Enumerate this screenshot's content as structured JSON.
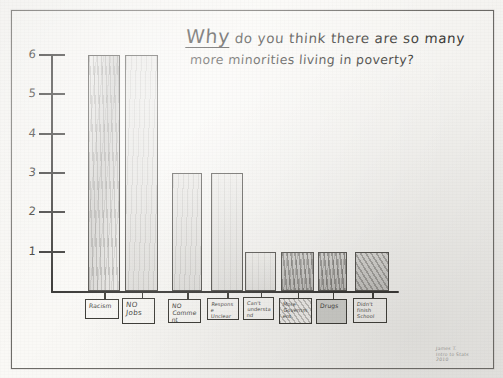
{
  "medium": {
    "description": "hand-drawn pencil bar chart on paper, photographed",
    "paper_color": "#f2f1ee",
    "ink_color": "#2e2d2b"
  },
  "title": {
    "line1_first_word": "Why",
    "line1_rest": "do you think there are so many",
    "line2": "more minorities living in poverty?",
    "full": "Why do you think there are so many more minorities living in poverty?"
  },
  "axis": {
    "y_ticks": [
      "6",
      "5",
      "4",
      "3",
      "2",
      "1"
    ],
    "y_max": 6,
    "y_min": 0
  },
  "signature": {
    "line1": "James T.",
    "line2": "Intro to Stats",
    "line3": "2010"
  },
  "chart_data": {
    "type": "bar",
    "title": "Why do you think there are so many more minorities living in poverty?",
    "xlabel": "",
    "ylabel": "",
    "ylim": [
      0,
      6
    ],
    "grid": false,
    "legend": "none",
    "categories": [
      "Racism",
      "NO Jobs",
      "NO Comment",
      "Response Unclear",
      "Can't understand Question",
      "More Government",
      "Drugs",
      "Didn't finish School"
    ],
    "values": [
      6,
      6,
      3,
      3,
      1,
      1,
      1,
      1
    ]
  },
  "bars": [
    {
      "label_l1": "Racism",
      "label_l2": "",
      "label_l3": "",
      "value": 6,
      "shading": "sh-vstreak",
      "label_style": "med",
      "label_box": "plain"
    },
    {
      "label_l1": "NO",
      "label_l2": "Jobs",
      "label_l3": "",
      "value": 6,
      "shading": "sh-light",
      "label_style": "big",
      "label_box": "plain"
    },
    {
      "label_l1": "NO",
      "label_l2": "Comment",
      "label_l3": "",
      "value": 3,
      "shading": "sh-light",
      "label_style": "med",
      "label_box": "plain"
    },
    {
      "label_l1": "Response",
      "label_l2": "Unclear",
      "label_l3": "",
      "value": 3,
      "shading": "sh-pale",
      "label_style": "",
      "label_box": "plain"
    },
    {
      "label_l1": "Can't",
      "label_l2": "understand",
      "label_l3": "Question",
      "value": 1,
      "shading": "sh-pale",
      "label_style": "",
      "label_box": "plain"
    },
    {
      "label_l1": "More",
      "label_l2": "Government",
      "label_l3": "",
      "value": 1,
      "shading": "sh-dark",
      "label_style": "",
      "label_box": "shaded-diag"
    },
    {
      "label_l1": "Drugs",
      "label_l2": "",
      "label_l3": "",
      "value": 1,
      "shading": "sh-dark",
      "label_style": "med",
      "label_box": "shaded"
    },
    {
      "label_l1": "Didn't",
      "label_l2": "finish",
      "label_l3": "School",
      "value": 1,
      "shading": "sh-diag",
      "label_style": "",
      "label_box": "plain"
    }
  ]
}
